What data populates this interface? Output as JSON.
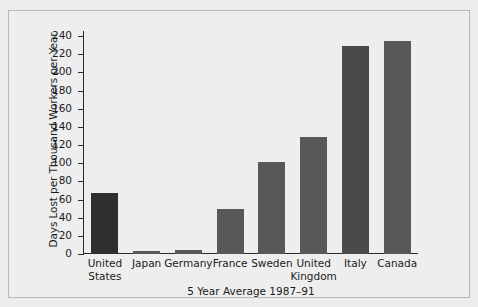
{
  "chart_data": {
    "type": "bar",
    "title": "",
    "xlabel": "5 Year Average 1987–91",
    "ylabel": "Days Lost per Thousand Workers per Year",
    "categories": [
      "United\nStates",
      "Japan",
      "Germany",
      "France",
      "Sweden",
      "United\nKingdom",
      "Italy",
      "Canada"
    ],
    "values": [
      67,
      3,
      4,
      50,
      101,
      129,
      229,
      234
    ],
    "ylim": [
      0,
      240
    ],
    "ytick_values": [
      0,
      20,
      40,
      60,
      80,
      100,
      120,
      140,
      160,
      180,
      200,
      220,
      240
    ],
    "ytick_labels": [
      "0",
      "20",
      "40",
      "60",
      "80",
      "100",
      "120",
      "140",
      "160",
      "180",
      "200",
      "220",
      "240"
    ],
    "grid": false,
    "legend": null,
    "bar_colors": [
      "#2f2f2f",
      "#58585a",
      "#58585a",
      "#58585a",
      "#58585a",
      "#58585a",
      "#4a4a4c",
      "#58585a"
    ]
  },
  "figure": {
    "background_color": "#ececed",
    "axis_color": "#2a2a2a",
    "text_color": "#1b1b1b"
  }
}
